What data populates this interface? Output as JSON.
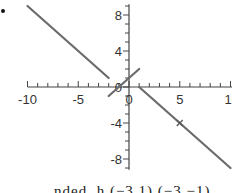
{
  "chart_data": {
    "type": "line",
    "title": "",
    "xlabel": "",
    "ylabel": "",
    "xlim": [
      -10,
      10
    ],
    "ylim": [
      -9,
      9
    ],
    "grid": false,
    "x_ticks": [
      -10,
      -5,
      0,
      5,
      10
    ],
    "x_tick_labels": [
      "-10",
      "-5",
      "0",
      "5",
      "10"
    ],
    "y_ticks": [
      8,
      4,
      0,
      -4,
      -8
    ],
    "y_tick_labels": [
      "8",
      "4",
      "0",
      "-4",
      "-8"
    ],
    "series": [
      {
        "name": "left segment",
        "points": [
          [
            -10,
            9
          ],
          [
            -2,
            1
          ]
        ]
      },
      {
        "name": "middle segment",
        "points": [
          [
            -2,
            -1
          ],
          [
            1,
            2
          ]
        ]
      },
      {
        "name": "right segment",
        "points": [
          [
            1,
            0
          ],
          [
            10,
            -9
          ]
        ]
      }
    ],
    "markers": [
      {
        "symbol": "x",
        "x": 5,
        "y": -4
      }
    ],
    "line_color": "#6b6b6b"
  },
  "caption": {
    "text": "nded. h  (−3,1)  (−3,−1)"
  }
}
